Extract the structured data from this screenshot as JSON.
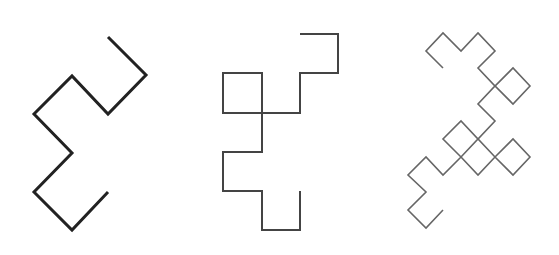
{
  "diagram": {
    "background": "#ffffff",
    "figures": [
      {
        "name": "dragon-curve-iteration-3",
        "segments": 8,
        "stroke": "#222222",
        "stroke_width": 3,
        "points": [
          [
            108,
            37
          ],
          [
            146,
            75
          ],
          [
            108,
            114
          ],
          [
            72,
            76
          ],
          [
            34,
            114
          ],
          [
            72,
            153
          ],
          [
            34,
            192
          ],
          [
            72,
            230
          ],
          [
            108,
            192
          ]
        ]
      },
      {
        "name": "dragon-curve-iteration-4",
        "segments": 16,
        "stroke": "#444444",
        "stroke_width": 2,
        "points": [
          [
            300,
            34
          ],
          [
            338,
            34
          ],
          [
            338,
            73
          ],
          [
            300,
            73
          ],
          [
            300,
            113
          ],
          [
            262,
            113
          ],
          [
            262,
            73
          ],
          [
            223,
            73
          ],
          [
            223,
            113
          ],
          [
            262,
            113
          ],
          [
            262,
            152
          ],
          [
            223,
            152
          ],
          [
            223,
            191
          ],
          [
            262,
            191
          ],
          [
            262,
            230
          ],
          [
            300,
            230
          ],
          [
            300,
            191
          ]
        ]
      },
      {
        "name": "dragon-curve-iteration-5",
        "segments": 32,
        "stroke": "#666666",
        "stroke_width": 1.6,
        "grid_x": [
          408,
          426,
          443,
          461,
          478,
          495,
          513,
          530
        ],
        "grid_y": [
          33,
          51,
          68,
          86,
          104,
          121,
          139,
          157,
          175,
          192,
          210,
          228
        ],
        "grid_points": [
          [
            2,
            2
          ],
          [
            1,
            1
          ],
          [
            2,
            0
          ],
          [
            3,
            1
          ],
          [
            4,
            0
          ],
          [
            5,
            1
          ],
          [
            4,
            2
          ],
          [
            5,
            3
          ],
          [
            6,
            2
          ],
          [
            7,
            3
          ],
          [
            6,
            4
          ],
          [
            5,
            3
          ],
          [
            4,
            4
          ],
          [
            5,
            5
          ],
          [
            4,
            6
          ],
          [
            3,
            5
          ],
          [
            2,
            6
          ],
          [
            3,
            7
          ],
          [
            4,
            8
          ],
          [
            5,
            7
          ],
          [
            6,
            6
          ],
          [
            7,
            7
          ],
          [
            6,
            8
          ],
          [
            5,
            7
          ],
          [
            4,
            6
          ],
          [
            3,
            7
          ],
          [
            2,
            8
          ],
          [
            1,
            7
          ],
          [
            0,
            8
          ],
          [
            1,
            9
          ],
          [
            0,
            10
          ],
          [
            1,
            11
          ],
          [
            2,
            10
          ]
        ]
      }
    ]
  }
}
